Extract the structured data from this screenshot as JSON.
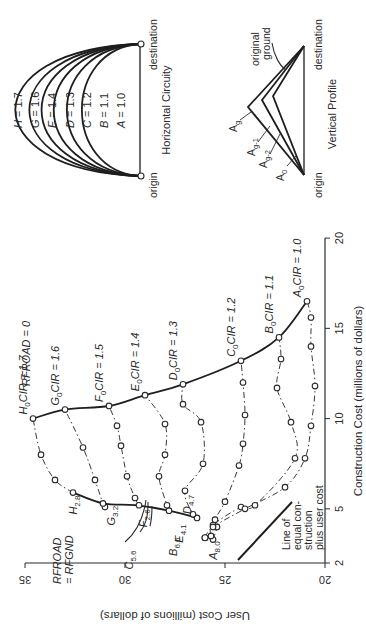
{
  "chart_data": {
    "type": "line",
    "title": "",
    "xlabel": "Construction Cost (millions of dollars)",
    "ylabel": "User Cost (millions of dollars)",
    "xlim": [
      2,
      20
    ],
    "ylim": [
      20,
      35
    ],
    "x_ticks": [
      "2",
      "5",
      "10",
      "15",
      "20"
    ],
    "y_ticks": [
      "20",
      "25",
      "30",
      "35"
    ],
    "grid": false,
    "orientation_note": "figure printed rotated 90 degrees counter-clockwise",
    "series": [
      {
        "name": "H (CIR = 1.7)",
        "style": "dash-dot",
        "points": [
          [
            5.9,
            32.6
          ],
          [
            6.6,
            33.5
          ],
          [
            8.0,
            34.2
          ],
          [
            10.0,
            34.6
          ]
        ]
      },
      {
        "name": "G (CIR = 1.6)",
        "style": "dash-dot",
        "points": [
          [
            5.1,
            31.0
          ],
          [
            5.3,
            31.1
          ],
          [
            6.6,
            31.5
          ],
          [
            8.4,
            32.1
          ],
          [
            10.5,
            33.0
          ]
        ]
      },
      {
        "name": "F (CIR = 1.5)",
        "style": "dash-dot",
        "points": [
          [
            5.2,
            29.3
          ],
          [
            5.6,
            29.5
          ],
          [
            6.8,
            29.9
          ],
          [
            8.5,
            30.2
          ],
          [
            9.6,
            30.4
          ],
          [
            10.7,
            30.8
          ]
        ]
      },
      {
        "name": "E (CIR = 1.4)",
        "style": "dash-dot",
        "points": [
          [
            4.9,
            27.8
          ],
          [
            5.2,
            27.9
          ],
          [
            6.8,
            28.3
          ],
          [
            8.0,
            28.0
          ],
          [
            9.7,
            28.0
          ],
          [
            11.3,
            29.0
          ]
        ]
      },
      {
        "name": "D (CIR = 1.3)",
        "style": "dash-dot",
        "points": [
          [
            4.5,
            26.4
          ],
          [
            4.7,
            26.6
          ],
          [
            6.0,
            27.0
          ],
          [
            7.5,
            26.1
          ],
          [
            9.8,
            26.2
          ],
          [
            10.8,
            27.1
          ],
          [
            11.9,
            27.1
          ]
        ]
      },
      {
        "name": "C (CIR = 1.2)",
        "style": "dash-dot",
        "points": [
          [
            3.3,
            25.6
          ],
          [
            4.0,
            25.4
          ],
          [
            4.4,
            25.5
          ],
          [
            5.4,
            25.0
          ],
          [
            7.4,
            24.3
          ],
          [
            8.6,
            24.1
          ],
          [
            10.2,
            24.0
          ],
          [
            12.0,
            24.1
          ],
          [
            13.2,
            24.2
          ]
        ]
      },
      {
        "name": "B (CIR = 1.1)",
        "style": "dash-dot",
        "points": [
          [
            3.5,
            25.7
          ],
          [
            4.1,
            25.6
          ],
          [
            5.1,
            24.2
          ],
          [
            5.2,
            23.5
          ],
          [
            7.8,
            21.5
          ],
          [
            9.8,
            21.7
          ],
          [
            11.7,
            22.4
          ],
          [
            13.3,
            22.2
          ],
          [
            14.5,
            22.3
          ]
        ]
      },
      {
        "name": "A (CIR = 1.0)",
        "style": "dash-dot",
        "points": [
          [
            3.4,
            26.0
          ],
          [
            4.0,
            25.6
          ],
          [
            5.0,
            24.0
          ],
          [
            6.2,
            22.0
          ],
          [
            7.8,
            21.0
          ],
          [
            9.6,
            20.7
          ],
          [
            11.8,
            20.5
          ],
          [
            14.0,
            20.7
          ],
          [
            15.6,
            20.7
          ],
          [
            16.5,
            20.9
          ]
        ]
      },
      {
        "name": "RFROAD = 0 envelope",
        "style": "solid",
        "points": [
          [
            10.0,
            34.6
          ],
          [
            10.5,
            33.0
          ],
          [
            10.7,
            30.8
          ],
          [
            11.3,
            29.0
          ],
          [
            11.9,
            27.1
          ],
          [
            13.2,
            24.2
          ],
          [
            14.5,
            22.3
          ],
          [
            16.5,
            20.9
          ]
        ]
      },
      {
        "name": "RFROAD = RFGND envelope",
        "style": "solid",
        "points": [
          [
            5.9,
            32.6
          ],
          [
            5.3,
            31.1
          ],
          [
            5.2,
            29.5
          ],
          [
            4.9,
            27.8
          ],
          [
            4.5,
            26.4
          ]
        ]
      }
    ],
    "annotations": [
      "H0 CIR = 1.7",
      "G0 CIR = 1.6",
      "F0 CIR = 1.5",
      "E0 CIR = 1.4",
      "D0 CIR = 1.3",
      "C0 CIR = 1.2",
      "B0 CIR = 1.1",
      "A0 CIR = 1.0",
      "RFROAD = 0",
      "RFROAD = RFGND",
      "H2.8",
      "G3.2",
      "F2.6",
      "E4.1",
      "D4.7",
      "C5.6",
      "B6.6",
      "A8.0",
      "Line of equal construction plus user cost"
    ]
  },
  "labels": {
    "xlabel": "Construction Cost (millions of dollars)",
    "ylabel": "User Cost (millions of dollars)",
    "x_ticks": [
      {
        "v": 2,
        "t": "2"
      },
      {
        "v": 5,
        "t": "5"
      },
      {
        "v": 10,
        "t": "10"
      },
      {
        "v": 15,
        "t": "15"
      },
      {
        "v": 20,
        "t": "20"
      }
    ],
    "y_ticks": [
      {
        "v": 20,
        "t": "20"
      },
      {
        "v": 25,
        "t": "25"
      },
      {
        "v": 30,
        "t": "30"
      },
      {
        "v": 35,
        "t": "35"
      }
    ],
    "rfroad0": "RFROAD = 0",
    "rfroad_rfgnd_1": "RFROAD",
    "rfroad_rfgnd_2": "= RFGND",
    "equal_line": [
      "Line of",
      "equal con-",
      "struction",
      "plus user cost"
    ],
    "cir_labels": {
      "H": {
        "letter": "H",
        "sub": "0",
        "text": "CIR = 1.7"
      },
      "G": {
        "letter": "G",
        "sub": "0",
        "text": "CIR = 1.6"
      },
      "F": {
        "letter": "F",
        "sub": "0",
        "text": "CIR = 1.5"
      },
      "E": {
        "letter": "E",
        "sub": "0",
        "text": "CIR = 1.4"
      },
      "D": {
        "letter": "D",
        "sub": "0",
        "text": "CIR = 1.3"
      },
      "C": {
        "letter": "C",
        "sub": "0",
        "text": "CIR = 1.2"
      },
      "B": {
        "letter": "B",
        "sub": "0",
        "text": "CIR = 1.1"
      },
      "A": {
        "letter": "A",
        "sub": "0",
        "text": "CIR = 1.0"
      }
    },
    "grade_labels": {
      "H": {
        "letter": "H",
        "sub": "2.8"
      },
      "G": {
        "letter": "G",
        "sub": "3.2"
      },
      "F": {
        "letter": "F",
        "sub": "2.6"
      },
      "E": {
        "letter": "E",
        "sub": "4.1"
      },
      "D": {
        "letter": "D",
        "sub": "4.7"
      },
      "C": {
        "letter": "C",
        "sub": "5.6"
      },
      "B": {
        "letter": "B",
        "sub": "6.6"
      },
      "A": {
        "letter": "A",
        "sub": "8.0"
      }
    }
  },
  "horizontal_inset": {
    "title": "Horizontal Circuity",
    "origin": "origin",
    "destination": "destination",
    "curves": [
      {
        "letter": "H",
        "text": "= 1.7"
      },
      {
        "letter": "G",
        "text": "= 1.6"
      },
      {
        "letter": "E",
        "text": "= 1.4"
      },
      {
        "letter": "D",
        "text": "= 1.3"
      },
      {
        "letter": "C",
        "text": "= 1.2"
      },
      {
        "letter": "B",
        "text": "= 1.1"
      },
      {
        "letter": "A",
        "text": "= 1.0"
      }
    ]
  },
  "vertical_inset": {
    "title": "Vertical Profile",
    "origin": "origin",
    "destination": "destination",
    "ground_1": "original",
    "ground_2": "ground",
    "labels": [
      {
        "letter": "A",
        "sub": "g"
      },
      {
        "letter": "A",
        "sub": "g-1"
      },
      {
        "letter": "A",
        "sub": "g-2"
      },
      {
        "letter": "A",
        "sub": "0"
      }
    ]
  }
}
